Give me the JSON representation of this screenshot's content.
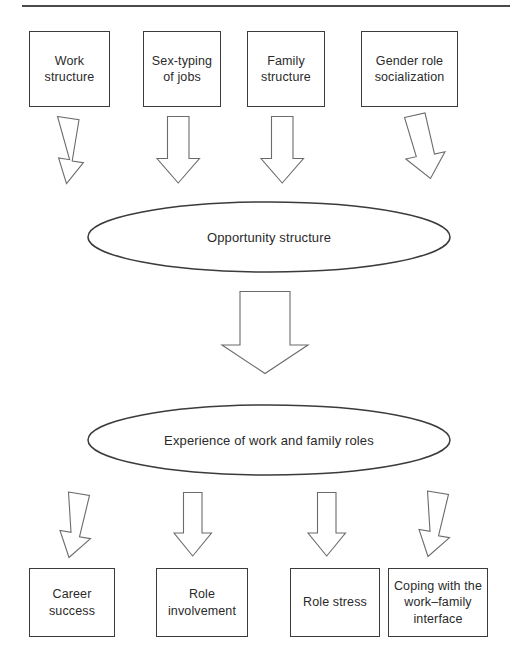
{
  "figure": {
    "type": "flowchart",
    "orientation": "top-to-bottom",
    "divider": "horizontal-rule",
    "levels": 4
  },
  "top_row": {
    "label": "antecedent-factors",
    "boxes": [
      {
        "id": "work-structure",
        "text": "Work\nstructure"
      },
      {
        "id": "sex-typing-of-jobs",
        "text": "Sex-typing\nof jobs"
      },
      {
        "id": "family-structure",
        "text": "Family\nstructure"
      },
      {
        "id": "gender-role-socialization",
        "text": "Gender role\nsocialization"
      }
    ]
  },
  "mid_upper": {
    "label": "opportunity-structure",
    "text": "Opportunity structure",
    "shape": "ellipse"
  },
  "mid_lower": {
    "label": "experience-of-roles",
    "text": "Experience of work and family roles",
    "shape": "ellipse"
  },
  "bottom_row": {
    "label": "outcomes",
    "boxes": [
      {
        "id": "career-success",
        "text": "Career\nsuccess"
      },
      {
        "id": "role-involvement",
        "text": "Role\ninvolvement"
      },
      {
        "id": "role-stress",
        "text": "Role stress"
      },
      {
        "id": "coping-work-family-interface",
        "text": "Coping with the\nwork–family\ninterface"
      }
    ]
  },
  "arrows": {
    "upper_group": [
      {
        "id": "arrow-work-structure",
        "tilt": "right"
      },
      {
        "id": "arrow-sex-typing",
        "tilt": "none"
      },
      {
        "id": "arrow-family-structure",
        "tilt": "none"
      },
      {
        "id": "arrow-gender-role",
        "tilt": "left"
      }
    ],
    "center": {
      "id": "arrow-opportunity-to-experience",
      "tilt": "none"
    },
    "lower_group": [
      {
        "id": "arrow-career-success",
        "tilt": "left"
      },
      {
        "id": "arrow-role-involvement",
        "tilt": "none"
      },
      {
        "id": "arrow-role-stress",
        "tilt": "none"
      },
      {
        "id": "arrow-coping",
        "tilt": "left"
      }
    ]
  },
  "style": {
    "stroke": "#3b3b3b",
    "arrow_stroke": "#6b6b6b",
    "text_color": "#2a2a2a",
    "background": "#ffffff"
  }
}
